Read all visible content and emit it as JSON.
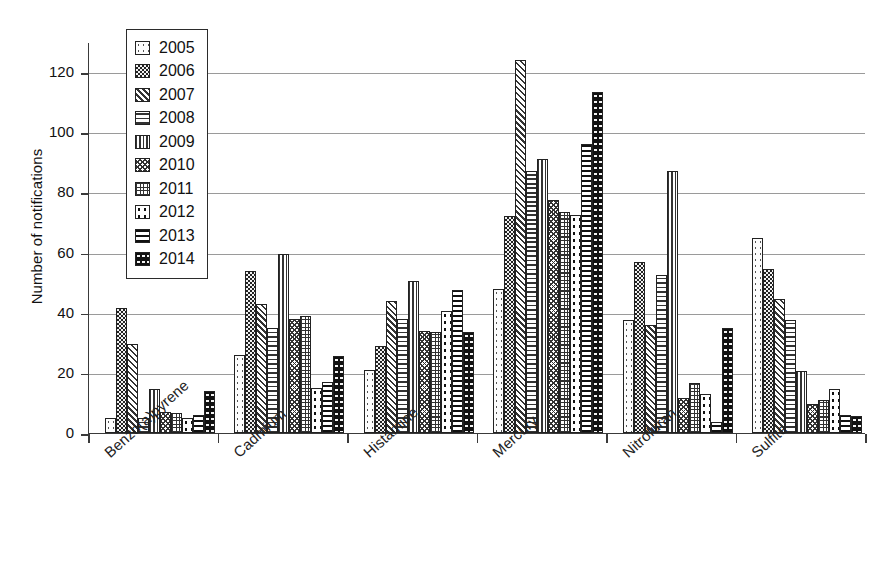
{
  "chart_data": {
    "type": "bar",
    "title": "",
    "xlabel": "",
    "ylabel": "Number of notifications",
    "ylim": [
      0,
      130
    ],
    "yticks": [
      0,
      20,
      40,
      60,
      80,
      100,
      120
    ],
    "grid": true,
    "legend_position": "top-left",
    "categories": [
      "Benzo(a)pyrene",
      "Cadmium",
      "Histamine",
      "Mercury",
      "Nitrofuran",
      "Sulfite"
    ],
    "series": [
      {
        "name": "2005",
        "values": [
          5,
          26,
          21,
          48,
          37.5,
          65
        ]
      },
      {
        "name": "2006",
        "values": [
          41.5,
          54,
          29,
          72,
          57,
          54.5
        ]
      },
      {
        "name": "2007",
        "values": [
          29.5,
          43,
          44,
          124,
          36,
          44.5
        ]
      },
      {
        "name": "2008",
        "values": [
          5,
          35,
          38,
          87,
          52.5,
          37.5
        ]
      },
      {
        "name": "2009",
        "values": [
          14.5,
          59.5,
          50.5,
          91,
          87,
          20.5
        ]
      },
      {
        "name": "2010",
        "values": [
          7,
          38,
          34,
          77.5,
          11.5,
          9.5
        ]
      },
      {
        "name": "2011",
        "values": [
          6.5,
          39,
          33.5,
          73.5,
          16.5,
          11
        ]
      },
      {
        "name": "2012",
        "values": [
          5,
          15,
          40.5,
          72.5,
          13,
          14.5
        ]
      },
      {
        "name": "2013",
        "values": [
          6,
          17,
          47.5,
          96,
          3.5,
          6
        ]
      },
      {
        "name": "2014",
        "values": [
          14,
          25.5,
          33.5,
          113.5,
          35,
          5.5
        ]
      }
    ]
  },
  "legend": {
    "items": [
      {
        "label": "2005",
        "pattern": "p2005"
      },
      {
        "label": "2006",
        "pattern": "p2006"
      },
      {
        "label": "2007",
        "pattern": "p2007"
      },
      {
        "label": "2008",
        "pattern": "p2008"
      },
      {
        "label": "2009",
        "pattern": "p2009"
      },
      {
        "label": "2010",
        "pattern": "p2010"
      },
      {
        "label": "2011",
        "pattern": "p2011"
      },
      {
        "label": "2012",
        "pattern": "p2012"
      },
      {
        "label": "2013",
        "pattern": "p2013"
      },
      {
        "label": "2014",
        "pattern": "p2014"
      }
    ]
  },
  "colors": {
    "axis": "#3a3a3a",
    "grid": "#9a9a9a",
    "text": "#111111",
    "bar_outline": "#222222",
    "background": "#ffffff"
  }
}
